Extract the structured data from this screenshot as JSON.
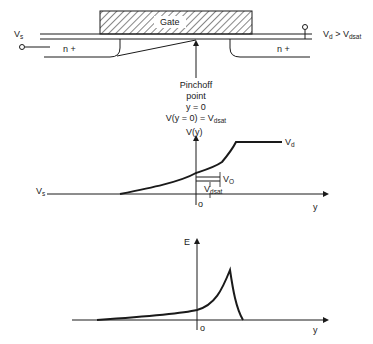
{
  "device": {
    "gate_label": "Gate",
    "source_label": "V",
    "source_sub": "s",
    "drain_label": "V",
    "drain_sub": "d",
    "drain_condition": " > V",
    "drain_condition_sub": "dsat",
    "source_region_label": "n +",
    "drain_region_label": "n +"
  },
  "pinchoff": {
    "line1": "Pinchoff",
    "line2": "point",
    "line3": "y = 0",
    "line4": "V(y = 0) = V",
    "line4_sub": "dsat"
  },
  "potential_plot": {
    "y_axis_label": "V(y)",
    "x_axis_label": "y",
    "origin_label": "o",
    "vs_label": "V",
    "vs_sub": "s",
    "vd_label": "V",
    "vd_sub": "d",
    "v0_label": "V",
    "v0_sub": "O",
    "vdsat_label": "V",
    "vdsat_sub": "dsat"
  },
  "field_plot": {
    "y_axis_label": "E",
    "x_axis_label": "y",
    "origin_label": "o"
  }
}
